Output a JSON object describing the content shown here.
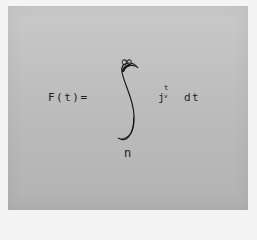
{
  "equation": {
    "lhs": "F(t)=",
    "integral_upper_limit": "∞",
    "integral_lower_limit": "n",
    "integrand_base": "j",
    "integrand_superscript": "t",
    "integrand_subscript": "v",
    "differential": "dt"
  },
  "colors": {
    "paper": "#bdbdbd",
    "ink": "#1e1e1e"
  }
}
